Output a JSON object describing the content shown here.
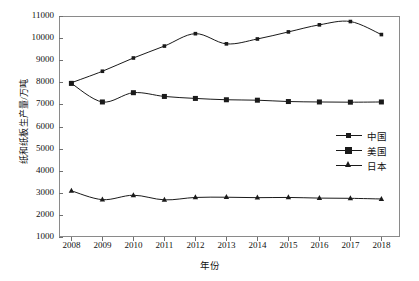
{
  "chart_data": {
    "type": "line",
    "title": "",
    "xlabel": "年份",
    "ylabel": "纸和纸板生产量/万吨",
    "x": [
      2008,
      2009,
      2010,
      2011,
      2012,
      2013,
      2014,
      2015,
      2016,
      2017,
      2018
    ],
    "categories": [
      "2008",
      "2009",
      "2010",
      "2011",
      "2012",
      "2013",
      "2014",
      "2015",
      "2016",
      "2017",
      "2018"
    ],
    "xlim": [
      2007.6,
      2018.6
    ],
    "ylim": [
      1000,
      11000
    ],
    "ytick_labels": [
      "1000",
      "2000",
      "3000",
      "4000",
      "5000",
      "6000",
      "7000",
      "8000",
      "9000",
      "10000",
      "11000"
    ],
    "yticks": [
      1000,
      2000,
      3000,
      4000,
      5000,
      6000,
      7000,
      8000,
      9000,
      10000,
      11000
    ],
    "grid": false,
    "legend_position": "center-right",
    "series": [
      {
        "name": "中国",
        "marker": "square-small",
        "color": "#1a1a1a",
        "values": [
          7980,
          8500,
          9100,
          9640,
          10200,
          9740,
          9960,
          10280,
          10600,
          10750,
          10160
        ]
      },
      {
        "name": "美国",
        "marker": "square-large",
        "color": "#1a1a1a",
        "values": [
          7950,
          7110,
          7530,
          7360,
          7270,
          7210,
          7190,
          7130,
          7110,
          7100,
          7110
        ]
      },
      {
        "name": "日本",
        "marker": "triangle",
        "color": "#1a1a1a",
        "values": [
          3090,
          2690,
          2890,
          2680,
          2790,
          2800,
          2780,
          2790,
          2760,
          2750,
          2720
        ]
      }
    ]
  },
  "axes": {
    "x_title": "年份",
    "y_title": "纸和纸板生产量/万吨"
  },
  "legend": {
    "items": [
      {
        "label": "中国"
      },
      {
        "label": "美国"
      },
      {
        "label": "日本"
      }
    ]
  },
  "style": {
    "line_color": "#1a1a1a",
    "frame_color": "#8a8a8a",
    "background": "#ffffff"
  }
}
